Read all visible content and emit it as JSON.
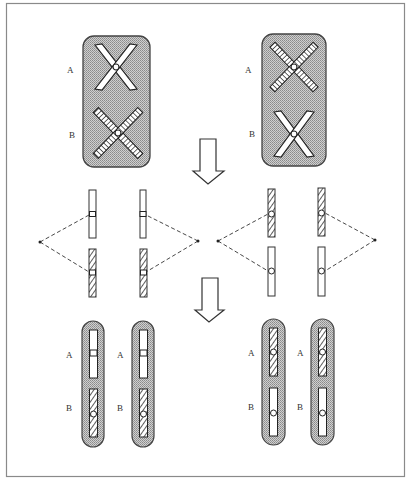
{
  "figure": {
    "frame": {
      "stroke": "#888888"
    },
    "colors": {
      "envelope_fill": "#bdbdbd",
      "envelope_stroke": "#444444",
      "chromatid_fill": "#ffffff",
      "hatch_stroke": "#333333",
      "line": "#222222"
    },
    "top_panels": [
      {
        "id": "left",
        "labels": [
          "A",
          "B"
        ],
        "chiasmata": [
          {
            "locus": "A",
            "pattern": "plain"
          },
          {
            "locus": "B",
            "pattern": "hatched"
          }
        ]
      },
      {
        "id": "right",
        "labels": [
          "A",
          "B"
        ],
        "chiasmata": [
          {
            "locus": "A",
            "pattern": "hatched"
          },
          {
            "locus": "B",
            "pattern": "plain"
          }
        ]
      }
    ],
    "arrows": [
      {
        "id": "arrow-1",
        "direction": "down"
      },
      {
        "id": "arrow-2",
        "direction": "down"
      }
    ],
    "middle_groups": [
      {
        "id": "left",
        "spindle_pole": "left-and-right",
        "top_pattern": "plain",
        "bottom_pattern": "hatched"
      },
      {
        "id": "right",
        "spindle_pole": "left-and-right",
        "top_pattern": "hatched",
        "bottom_pattern": "plain"
      }
    ],
    "bottom_pairs": [
      {
        "id": "left-1",
        "labels": [
          "A",
          "B"
        ],
        "segments": [
          "plain",
          "hatched"
        ]
      },
      {
        "id": "left-2",
        "labels": [
          "A",
          "B"
        ],
        "segments": [
          "plain",
          "hatched"
        ]
      },
      {
        "id": "right-1",
        "labels": [
          "A",
          "B"
        ],
        "segments": [
          "hatched",
          "plain"
        ]
      },
      {
        "id": "right-2",
        "labels": [
          "A",
          "B"
        ],
        "segments": [
          "hatched",
          "plain"
        ]
      }
    ]
  }
}
